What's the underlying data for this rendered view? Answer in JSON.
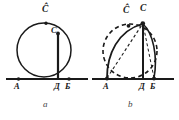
{
  "figure": {
    "type": "geometric-diagram",
    "panels": [
      {
        "id": "a",
        "caption": "a",
        "baseline_label": "horizontal-axis",
        "points": [
          {
            "name": "A",
            "label": "A",
            "x": 17,
            "y": 79
          },
          {
            "name": "D",
            "label": "Д",
            "x": 58,
            "y": 79
          },
          {
            "name": "B",
            "label": "Б",
            "x": 70,
            "y": 79
          },
          {
            "name": "C",
            "label": "C",
            "x": 58,
            "y": 33
          },
          {
            "name": "Chat",
            "label": "Ĉ",
            "x": 47,
            "y": 9
          }
        ],
        "shapes": [
          "circle-solid",
          "vertical-vector-DC",
          "baseline"
        ]
      },
      {
        "id": "b",
        "caption": "b",
        "baseline_label": "horizontal-axis",
        "points": [
          {
            "name": "A",
            "label": "A",
            "x": 106,
            "y": 79
          },
          {
            "name": "D",
            "label": "Д",
            "x": 143,
            "y": 79
          },
          {
            "name": "B",
            "label": "Б",
            "x": 154,
            "y": 79
          },
          {
            "name": "C",
            "label": "C",
            "x": 143,
            "y": 22
          },
          {
            "name": "Chat",
            "label": "Ĉ",
            "x": 126,
            "y": 22
          }
        ],
        "shapes": [
          "circle-dashed",
          "curve-A-to-C-solid",
          "curve-B-to-C-solid",
          "line-A-to-C-dashed",
          "vertical-line-DC",
          "baseline"
        ]
      }
    ],
    "labels": {
      "a_A": "A",
      "a_D": "Д",
      "a_B": "Б",
      "a_C": "C",
      "a_Chat": "Ĉ",
      "b_A": "A",
      "b_D": "Д",
      "b_B": "Б",
      "b_C": "C",
      "b_Chat": "Ĉ",
      "caption_a": "a",
      "caption_b": "b"
    },
    "colors": {
      "ink": "#1a1a1a",
      "background": "#ffffff",
      "caption": "#444444"
    }
  }
}
